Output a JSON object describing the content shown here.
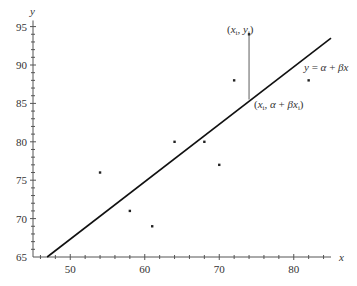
{
  "chart_data": {
    "type": "scatter",
    "title": "",
    "xlabel": "x",
    "ylabel": "y",
    "xlim": [
      45,
      85
    ],
    "ylim": [
      65,
      95
    ],
    "grid": false,
    "x_ticks": [
      50,
      60,
      70,
      80
    ],
    "y_ticks": [
      65,
      70,
      75,
      80,
      85,
      90,
      95
    ],
    "x_tick_labels": [
      "50",
      "60",
      "70",
      "80"
    ],
    "y_tick_labels": [
      "65",
      "70",
      "75",
      "80",
      "85",
      "90",
      "95"
    ],
    "series": [
      {
        "name": "observations",
        "type": "scatter",
        "points": [
          {
            "x": 54,
            "y": 76
          },
          {
            "x": 58,
            "y": 71
          },
          {
            "x": 61,
            "y": 69
          },
          {
            "x": 64,
            "y": 80
          },
          {
            "x": 68,
            "y": 80
          },
          {
            "x": 70,
            "y": 77
          },
          {
            "x": 72,
            "y": 88
          },
          {
            "x": 82,
            "y": 88
          },
          {
            "x": 74,
            "y": 94
          }
        ]
      },
      {
        "name": "regression line",
        "type": "line",
        "equation": "y = α + βx",
        "points": [
          {
            "x": 46.9,
            "y": 65
          },
          {
            "x": 85,
            "y": 93.5
          }
        ]
      }
    ],
    "annotations": [
      {
        "text_parts": [
          "(",
          "x",
          "i",
          ", ",
          "y",
          "i",
          ")"
        ],
        "label": "(xi, yi)",
        "at": {
          "x": 74,
          "y": 94
        }
      },
      {
        "label": "y = α + βx",
        "at": {
          "x": 81,
          "y": 89
        }
      },
      {
        "label": "(xi, α + βxi)",
        "at": {
          "x": 74,
          "y": 85.5
        }
      }
    ],
    "residual_segment": {
      "x": 74,
      "y_from": 94,
      "y_to": 85.5
    }
  },
  "labels": {
    "x_axis": "x",
    "y_axis": "y",
    "line_eq": {
      "y": "y",
      "eq": " = ",
      "alpha": "α",
      "plus": " + ",
      "beta": "β",
      "x": "x"
    },
    "point_label": {
      "open": "(",
      "x": "x",
      "sub": "i",
      "comma": ", ",
      "y": "y",
      "close": ")"
    },
    "fit_label": {
      "open": "(",
      "x": "x",
      "sub": "i",
      "comma": ", ",
      "alpha": "α",
      "plus": " + ",
      "beta": "β",
      "close": ")"
    }
  }
}
